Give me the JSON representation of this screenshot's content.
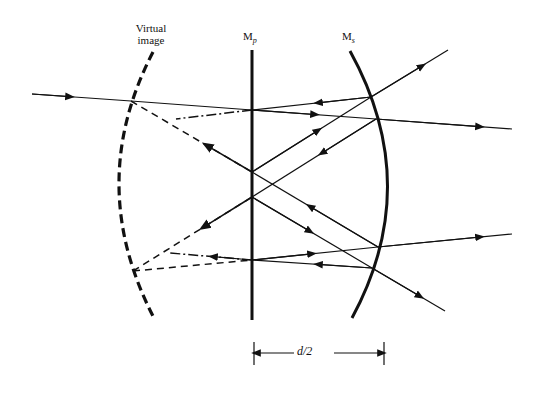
{
  "figure": {
    "type": "optics-ray-diagram",
    "labels": {
      "virtual_image_line1": "Virtual",
      "virtual_image_line2": "image",
      "mirror_plane_main": "M",
      "mirror_plane_sub": "p",
      "mirror_spherical_main": "M",
      "mirror_spherical_sub": "s",
      "separation": "d/2"
    },
    "elements": {
      "plane_mirror": {
        "name": "Mp",
        "x": 252,
        "y_top": 50,
        "y_bottom": 320,
        "style": "solid-thick"
      },
      "spherical_mirror": {
        "name": "Ms",
        "top": [
          350,
          51
        ],
        "apex": [
          387,
          185
        ],
        "bottom": [
          352,
          318
        ],
        "style": "solid-thick"
      },
      "virtual_image_surface": {
        "top": [
          153,
          52
        ],
        "apex": [
          118,
          185
        ],
        "bottom": [
          155,
          320
        ],
        "style": "dashed-thick"
      }
    },
    "dimension": {
      "label": "d/2",
      "x1": 254,
      "x2": 384,
      "y": 353
    }
  }
}
